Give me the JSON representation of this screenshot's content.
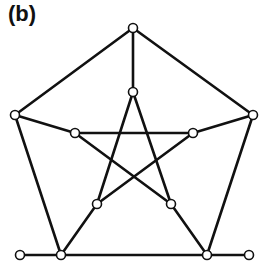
{
  "panel": {
    "label": "(b)"
  },
  "graph": {
    "nodes": [
      {
        "id": "o0",
        "x": 133,
        "y": 28
      },
      {
        "id": "o1",
        "x": 15,
        "y": 115
      },
      {
        "id": "o2",
        "x": 253,
        "y": 115
      },
      {
        "id": "o3",
        "x": 61,
        "y": 255
      },
      {
        "id": "o4",
        "x": 207,
        "y": 255
      },
      {
        "id": "i0",
        "x": 133,
        "y": 92
      },
      {
        "id": "i1",
        "x": 75,
        "y": 133
      },
      {
        "id": "i2",
        "x": 193,
        "y": 133
      },
      {
        "id": "i3",
        "x": 97,
        "y": 204
      },
      {
        "id": "i4",
        "x": 171,
        "y": 204
      },
      {
        "id": "l0",
        "x": 20,
        "y": 255
      },
      {
        "id": "l1",
        "x": 249,
        "y": 255
      }
    ],
    "edges": [
      [
        "o0",
        "o1"
      ],
      [
        "o0",
        "o2"
      ],
      [
        "o1",
        "o3"
      ],
      [
        "o2",
        "o4"
      ],
      [
        "o3",
        "o4"
      ],
      [
        "o0",
        "i0"
      ],
      [
        "o1",
        "i1"
      ],
      [
        "o2",
        "i2"
      ],
      [
        "o3",
        "i3"
      ],
      [
        "o4",
        "i4"
      ],
      [
        "i0",
        "i3"
      ],
      [
        "i0",
        "i4"
      ],
      [
        "i1",
        "i2"
      ],
      [
        "i1",
        "i4"
      ],
      [
        "i2",
        "i3"
      ],
      [
        "l0",
        "o3"
      ],
      [
        "o4",
        "l1"
      ]
    ]
  }
}
